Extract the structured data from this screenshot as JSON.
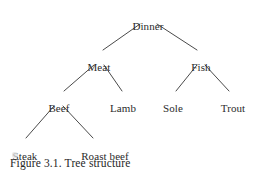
{
  "figure": {
    "caption": "Figure 3.1. Tree structure",
    "background_color": "#ffffff",
    "line_color": "#4a4a4a",
    "text_color": "#2b2b2b",
    "width": 261,
    "height": 175
  },
  "tree": {
    "nodes": [
      {
        "id": "dinner",
        "label": "Dinner",
        "x": 148,
        "y": 20,
        "level": 0
      },
      {
        "id": "meat",
        "label": "Meat",
        "x": 99,
        "y": 61,
        "level": 1
      },
      {
        "id": "fish",
        "label": "Fish",
        "x": 201,
        "y": 61,
        "level": 1
      },
      {
        "id": "beef",
        "label": "Beef",
        "x": 59,
        "y": 102,
        "level": 2
      },
      {
        "id": "lamb",
        "label": "Lamb",
        "x": 123,
        "y": 102,
        "level": 2
      },
      {
        "id": "sole",
        "label": "Sole",
        "x": 173,
        "y": 102,
        "level": 2
      },
      {
        "id": "trout",
        "label": "Trout",
        "x": 233,
        "y": 102,
        "level": 2
      },
      {
        "id": "steak",
        "label": "Steak",
        "x": 25,
        "y": 150,
        "level": 3
      },
      {
        "id": "roast-beef",
        "label": "Roast beef",
        "x": 105,
        "y": 150,
        "level": 3
      }
    ],
    "edges": [
      {
        "from": "dinner",
        "to": "meat",
        "x1": 140,
        "y1": 24,
        "x2": 103,
        "y2": 50
      },
      {
        "from": "dinner",
        "to": "fish",
        "x1": 157,
        "y1": 24,
        "x2": 197,
        "y2": 50
      },
      {
        "from": "meat",
        "to": "beef",
        "x1": 94,
        "y1": 65,
        "x2": 64,
        "y2": 91
      },
      {
        "from": "meat",
        "to": "lamb",
        "x1": 104,
        "y1": 65,
        "x2": 122,
        "y2": 91
      },
      {
        "from": "fish",
        "to": "sole",
        "x1": 197,
        "y1": 65,
        "x2": 176,
        "y2": 91
      },
      {
        "from": "fish",
        "to": "trout",
        "x1": 205,
        "y1": 65,
        "x2": 229,
        "y2": 91
      },
      {
        "from": "beef",
        "to": "steak",
        "x1": 54,
        "y1": 106,
        "x2": 26,
        "y2": 138
      },
      {
        "from": "beef",
        "to": "roast-beef",
        "x1": 63,
        "y1": 106,
        "x2": 93,
        "y2": 138
      }
    ]
  }
}
